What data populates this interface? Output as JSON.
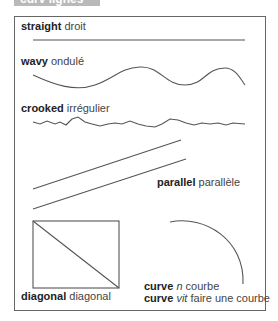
{
  "header": {
    "title": "curv lignes"
  },
  "entries": {
    "straight": {
      "en": "straight",
      "fr": "droit"
    },
    "wavy": {
      "en": "wavy",
      "fr": "ondulé"
    },
    "crooked": {
      "en": "crooked",
      "fr": "irrégulier"
    },
    "parallel": {
      "en": "parallel",
      "fr": "parallèle"
    },
    "diagonal": {
      "en": "diagonal",
      "fr": "diagonal"
    },
    "curve_noun": {
      "en": "curve",
      "pos": "n",
      "fr": "courbe"
    },
    "curve_verb": {
      "en": "curve",
      "pos": "vit",
      "fr": "faire une courbe"
    }
  },
  "colors": {
    "line": "#555555",
    "tab": "#b9b9b9",
    "frame": "#666666"
  }
}
